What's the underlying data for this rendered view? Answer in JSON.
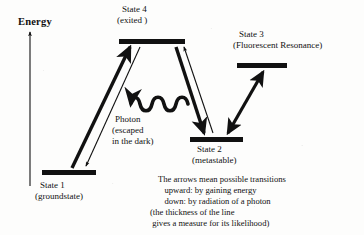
{
  "figure": {
    "type": "energy-level-diagram",
    "background_color": "#fdfdfc",
    "ink_color": "#111111",
    "axis": {
      "label": "Energy",
      "direction": "up",
      "x": 30,
      "y_top": 30,
      "y_bottom": 186
    },
    "states": [
      {
        "id": "state-1",
        "name": "State 1",
        "qualifier": "(groundstate)",
        "level_x1": 42,
        "level_x2": 96,
        "level_y": 172,
        "level_thickness": 5,
        "label_x": 40,
        "label_y": 177
      },
      {
        "id": "state-2",
        "name": "State 2",
        "qualifier": "(metastable)",
        "level_x1": 190,
        "level_x2": 243,
        "level_y": 139,
        "level_thickness": 5,
        "label_x": 196,
        "label_y": 144
      },
      {
        "id": "state-3",
        "name": "State 3",
        "qualifier": "(Fluorescent Resonance)",
        "level_x1": 237,
        "level_x2": 287,
        "level_y": 65,
        "level_thickness": 5,
        "label_x": 239,
        "label_y": 33
      },
      {
        "id": "state-4",
        "name": "State 4",
        "qualifier": "(exited )",
        "level_x1": 119,
        "level_x2": 185,
        "level_y": 41,
        "level_thickness": 5,
        "label_x": 122,
        "label_y": 8
      }
    ],
    "photon": {
      "label_lines": [
        "Photon",
        "(escaped",
        "in the dark)"
      ],
      "label_x": 115,
      "label_y": 116,
      "wave_x_start": 188,
      "wave_x_end": 124,
      "wave_y": 104,
      "wave_cycles": 4,
      "arrow_direction": "left"
    },
    "transitions": [
      {
        "id": "s1-to-s4-absorption",
        "from": "State 1",
        "to": "State 4",
        "style": "thick-filled",
        "direction": "upward",
        "meaning": "by gaining energy"
      },
      {
        "id": "s4-to-s1-emission",
        "from": "State 4",
        "to": "State 1",
        "style": "thin-outline",
        "direction": "down",
        "meaning": "by radiation of a photon"
      },
      {
        "id": "s4-to-s2-decay",
        "from": "State 4",
        "to": "State 2",
        "style": "thick-filled",
        "direction": "down",
        "meaning": "by radiation of a photon"
      },
      {
        "id": "s2-to-s4-excitation",
        "from": "State 2",
        "to": "State 4",
        "style": "thin-outline",
        "direction": "upward",
        "meaning": "by gaining energy"
      },
      {
        "id": "s2-s3-resonance",
        "from": "State 2",
        "to": "State 3",
        "style": "thick-double-headed",
        "direction": "both",
        "meaning": "fluorescent resonance"
      }
    ],
    "caption": {
      "x": 158,
      "y": 176,
      "lines": [
        "The arrows mean possible transitions",
        "   upward: by gaining energy",
        "   down: by radiation of a photon",
        "(the thickness of the line",
        " gives a measure for its likelihood)"
      ]
    }
  }
}
